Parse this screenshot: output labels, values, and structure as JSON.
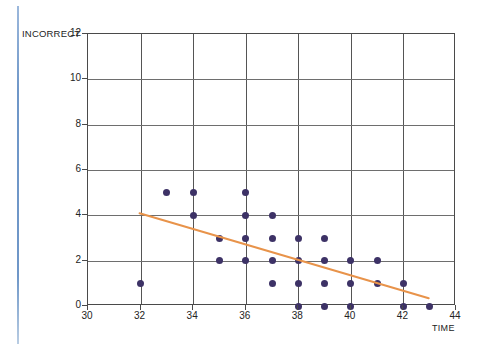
{
  "chart_data": {
    "type": "scatter",
    "title": "",
    "xlabel": "TIME",
    "ylabel": "INCORRECT",
    "xlim": [
      30,
      44
    ],
    "ylim": [
      0,
      12
    ],
    "xticks": [
      30,
      32,
      34,
      36,
      38,
      40,
      42,
      44
    ],
    "yticks": [
      0,
      2,
      4,
      6,
      8,
      10,
      12
    ],
    "grid": true,
    "legend": null,
    "marker_color": "#3d3266",
    "trendline_color": "#e8934a",
    "points": [
      {
        "x": 32,
        "y": 1
      },
      {
        "x": 33,
        "y": 5
      },
      {
        "x": 34,
        "y": 5
      },
      {
        "x": 34,
        "y": 4
      },
      {
        "x": 35,
        "y": 3
      },
      {
        "x": 35,
        "y": 2
      },
      {
        "x": 36,
        "y": 5
      },
      {
        "x": 36,
        "y": 4
      },
      {
        "x": 36,
        "y": 3
      },
      {
        "x": 36,
        "y": 2
      },
      {
        "x": 37,
        "y": 4
      },
      {
        "x": 37,
        "y": 3
      },
      {
        "x": 37,
        "y": 2
      },
      {
        "x": 37,
        "y": 1
      },
      {
        "x": 38,
        "y": 3
      },
      {
        "x": 38,
        "y": 2
      },
      {
        "x": 38,
        "y": 1
      },
      {
        "x": 38,
        "y": 0
      },
      {
        "x": 39,
        "y": 3
      },
      {
        "x": 39,
        "y": 2
      },
      {
        "x": 39,
        "y": 1
      },
      {
        "x": 39,
        "y": 0
      },
      {
        "x": 40,
        "y": 2
      },
      {
        "x": 40,
        "y": 1
      },
      {
        "x": 40,
        "y": 0
      },
      {
        "x": 41,
        "y": 2
      },
      {
        "x": 41,
        "y": 1
      },
      {
        "x": 42,
        "y": 1
      },
      {
        "x": 42,
        "y": 0
      },
      {
        "x": 43,
        "y": 0
      }
    ],
    "trendline": {
      "x0": 32,
      "y0": 4.05,
      "x1": 43,
      "y1": 0.3
    }
  },
  "axes": {
    "y_title": "INCORRECT",
    "x_title": "TIME",
    "xtick_labels": [
      "30",
      "32",
      "34",
      "36",
      "38",
      "40",
      "42",
      "44"
    ],
    "ytick_labels": [
      "0",
      "2",
      "4",
      "6",
      "8",
      "10",
      "12"
    ]
  }
}
